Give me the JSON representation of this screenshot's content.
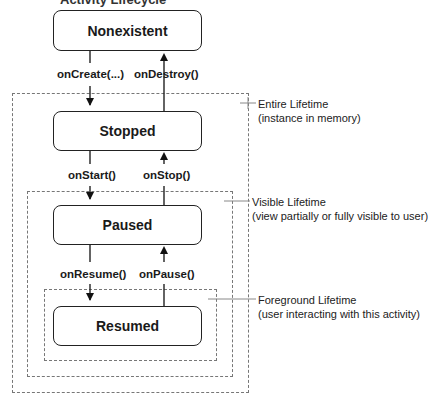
{
  "title_partial": "Activity Lifecycle",
  "states": [
    {
      "id": "nonexistent",
      "label": "Nonexistent"
    },
    {
      "id": "stopped",
      "label": "Stopped"
    },
    {
      "id": "paused",
      "label": "Paused"
    },
    {
      "id": "resumed",
      "label": "Resumed"
    }
  ],
  "transitions": {
    "on_create": "onCreate(...)",
    "on_destroy": "onDestroy()",
    "on_start": "onStart()",
    "on_stop": "onStop()",
    "on_resume": "onResume()",
    "on_pause": "onPause()"
  },
  "lifetimes": {
    "entire": {
      "title": "Entire Lifetime",
      "desc": "(instance in memory)"
    },
    "visible": {
      "title": "Visible Lifetime",
      "desc": "(view partially or fully visible to user)"
    },
    "foreground": {
      "title": "Foreground Lifetime",
      "desc": "(user interacting with this activity)"
    }
  }
}
